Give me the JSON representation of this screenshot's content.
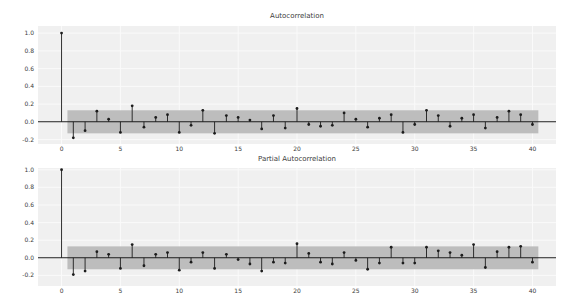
{
  "figure": {
    "background": "#ffffff",
    "plot_background": "#f0f0f0",
    "grid_color": "#fafafa",
    "band_color": "#bdbdbd",
    "stem_color": "#1c1c1c",
    "text_color": "#3c3c3c"
  },
  "chart_data": [
    {
      "type": "stem",
      "title": "Autocorrelation",
      "lags": [
        0,
        1,
        2,
        3,
        4,
        5,
        6,
        7,
        8,
        9,
        10,
        11,
        12,
        13,
        14,
        15,
        16,
        17,
        18,
        19,
        20,
        21,
        22,
        23,
        24,
        25,
        26,
        27,
        28,
        29,
        30,
        31,
        32,
        33,
        34,
        35,
        36,
        37,
        38,
        39,
        40
      ],
      "values": [
        1.0,
        -0.18,
        -0.1,
        0.12,
        0.03,
        -0.12,
        0.18,
        -0.06,
        0.05,
        0.08,
        -0.12,
        -0.04,
        0.13,
        -0.13,
        0.07,
        0.05,
        0.02,
        -0.08,
        0.07,
        -0.07,
        0.15,
        -0.03,
        -0.05,
        -0.04,
        0.1,
        0.03,
        -0.06,
        0.04,
        0.08,
        -0.12,
        -0.03,
        0.13,
        0.07,
        -0.05,
        0.04,
        0.08,
        -0.07,
        0.05,
        0.12,
        0.08,
        -0.03
      ],
      "confidence_band": {
        "low": -0.13,
        "high": 0.13,
        "x_start": 0.5,
        "x_end": 40.5
      },
      "xlim": [
        -2,
        42
      ],
      "ylim": [
        -0.25,
        1.08
      ],
      "grid": true,
      "legend": null,
      "xticks": [
        0,
        5,
        10,
        15,
        20,
        25,
        30,
        35,
        40
      ],
      "xticklabels": [
        "0",
        "5",
        "10",
        "15",
        "20",
        "25",
        "30",
        "35",
        "40"
      ],
      "yticks": [
        1.0,
        0.8,
        0.6,
        0.4,
        0.2,
        0.0,
        -0.2
      ],
      "yticklabels": [
        "1.0",
        "0.8",
        "0.6",
        "0.4",
        "0.2",
        "0.0",
        "-0.2"
      ]
    },
    {
      "type": "stem",
      "title": "Partial Autocorrelation",
      "lags": [
        0,
        1,
        2,
        3,
        4,
        5,
        6,
        7,
        8,
        9,
        10,
        11,
        12,
        13,
        14,
        15,
        16,
        17,
        18,
        19,
        20,
        21,
        22,
        23,
        24,
        25,
        26,
        27,
        28,
        29,
        30,
        31,
        32,
        33,
        34,
        35,
        36,
        37,
        38,
        39,
        40
      ],
      "values": [
        1.0,
        -0.19,
        -0.15,
        0.07,
        0.04,
        -0.12,
        0.15,
        -0.09,
        0.04,
        0.06,
        -0.14,
        -0.05,
        0.06,
        -0.12,
        0.04,
        -0.02,
        -0.07,
        -0.15,
        -0.05,
        -0.06,
        0.16,
        0.05,
        -0.05,
        -0.07,
        0.06,
        -0.03,
        -0.13,
        -0.06,
        0.12,
        -0.06,
        -0.06,
        0.12,
        0.08,
        0.06,
        0.03,
        0.15,
        -0.11,
        0.07,
        0.12,
        0.13,
        -0.05
      ],
      "confidence_band": {
        "low": -0.13,
        "high": 0.13,
        "x_start": 0.5,
        "x_end": 40.5
      },
      "xlim": [
        -2,
        42
      ],
      "ylim": [
        -0.32,
        1.02
      ],
      "grid": true,
      "legend": null,
      "xticks": [
        0,
        5,
        10,
        15,
        20,
        25,
        30,
        35,
        40
      ],
      "xticklabels": [
        "0",
        "5",
        "10",
        "15",
        "20",
        "25",
        "30",
        "35",
        "40"
      ],
      "yticks": [
        1.0,
        0.8,
        0.6,
        0.4,
        0.2,
        0.0,
        -0.2
      ],
      "yticklabels": [
        "1.0",
        "0.8",
        "0.6",
        "0.4",
        "0.2",
        "0.0",
        "-0.2"
      ]
    }
  ]
}
